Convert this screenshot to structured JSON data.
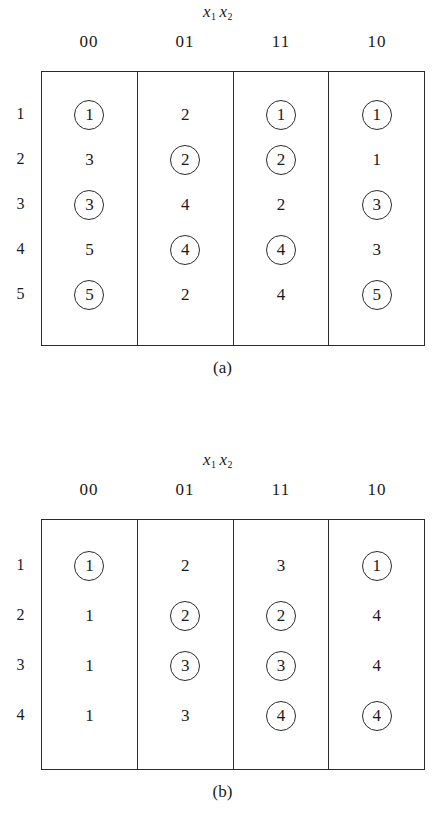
{
  "figure": {
    "variable_label": {
      "base1": "x",
      "sub1": "1",
      "base2": "x",
      "sub2": "2"
    },
    "column_headers": [
      "00",
      "01",
      "11",
      "10"
    ]
  },
  "panels": [
    {
      "id": "a",
      "caption": "(a)",
      "row_labels": [
        "1",
        "2",
        "3",
        "4",
        "5"
      ],
      "columns": [
        {
          "header": "00",
          "cells": [
            {
              "value": "1",
              "circled": true
            },
            {
              "value": "3",
              "circled": false
            },
            {
              "value": "3",
              "circled": true
            },
            {
              "value": "5",
              "circled": false
            },
            {
              "value": "5",
              "circled": true
            }
          ]
        },
        {
          "header": "01",
          "cells": [
            {
              "value": "2",
              "circled": false
            },
            {
              "value": "2",
              "circled": true
            },
            {
              "value": "4",
              "circled": false
            },
            {
              "value": "4",
              "circled": true
            },
            {
              "value": "2",
              "circled": false
            }
          ]
        },
        {
          "header": "11",
          "cells": [
            {
              "value": "1",
              "circled": true
            },
            {
              "value": "2",
              "circled": true
            },
            {
              "value": "2",
              "circled": false
            },
            {
              "value": "4",
              "circled": true
            },
            {
              "value": "4",
              "circled": false
            }
          ]
        },
        {
          "header": "10",
          "cells": [
            {
              "value": "1",
              "circled": true
            },
            {
              "value": "1",
              "circled": false
            },
            {
              "value": "3",
              "circled": true
            },
            {
              "value": "3",
              "circled": false
            },
            {
              "value": "5",
              "circled": true
            }
          ]
        }
      ]
    },
    {
      "id": "b",
      "caption": "(b)",
      "row_labels": [
        "1",
        "2",
        "3",
        "4"
      ],
      "columns": [
        {
          "header": "00",
          "cells": [
            {
              "value": "1",
              "circled": true
            },
            {
              "value": "1",
              "circled": false
            },
            {
              "value": "1",
              "circled": false
            },
            {
              "value": "1",
              "circled": false
            }
          ]
        },
        {
          "header": "01",
          "cells": [
            {
              "value": "2",
              "circled": false
            },
            {
              "value": "2",
              "circled": true
            },
            {
              "value": "3",
              "circled": true
            },
            {
              "value": "3",
              "circled": false
            }
          ]
        },
        {
          "header": "11",
          "cells": [
            {
              "value": "3",
              "circled": false
            },
            {
              "value": "2",
              "circled": true
            },
            {
              "value": "3",
              "circled": true
            },
            {
              "value": "4",
              "circled": true
            }
          ]
        },
        {
          "header": "10",
          "cells": [
            {
              "value": "1",
              "circled": true
            },
            {
              "value": "4",
              "circled": false
            },
            {
              "value": "4",
              "circled": false
            },
            {
              "value": "4",
              "circled": true
            }
          ]
        }
      ]
    }
  ],
  "colors": {
    "ink": "#1a1a1a",
    "rule": "#2b2b2b",
    "background": "#ffffff"
  }
}
